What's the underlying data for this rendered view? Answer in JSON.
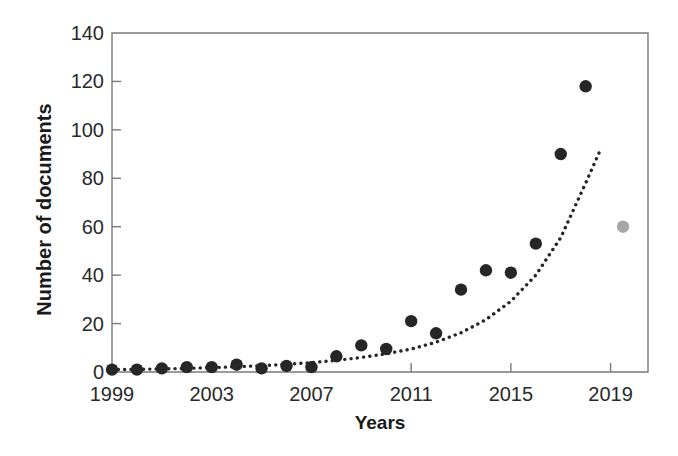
{
  "chart_data": {
    "type": "scatter",
    "title": "",
    "xlabel": "Years",
    "ylabel": "Number of documents",
    "xlim": [
      1999,
      2020.5
    ],
    "ylim": [
      0,
      140
    ],
    "grid": false,
    "legend": null,
    "x_ticks": [
      "1999",
      "2003",
      "2007",
      "2011",
      "2015",
      "2019"
    ],
    "x_tick_values": [
      1999,
      2003,
      2007,
      2011,
      2015,
      2019
    ],
    "y_ticks": [
      "0",
      "20",
      "40",
      "60",
      "80",
      "100",
      "120",
      "140"
    ],
    "y_tick_values": [
      0,
      20,
      40,
      60,
      80,
      100,
      120,
      140
    ],
    "series": [
      {
        "name": "Documents per year",
        "marker": "filled-circle",
        "color": "#262626",
        "x": [
          1999,
          2000,
          2001,
          2002,
          2003,
          2004,
          2005,
          2006,
          2007,
          2008,
          2009,
          2010,
          2011,
          2012,
          2013,
          2014,
          2015,
          2016,
          2017,
          2018
        ],
        "values": [
          1,
          1,
          1.5,
          2,
          2,
          3,
          1.5,
          2.5,
          2,
          6.5,
          11,
          9.5,
          21,
          16,
          34,
          42,
          41,
          53,
          90,
          118
        ]
      },
      {
        "name": "Partial year (incomplete)",
        "marker": "filled-circle",
        "color": "#a6a6a6",
        "x": [
          2019.5
        ],
        "values": [
          60
        ]
      }
    ],
    "trend": {
      "name": "Exponential trend",
      "style": "dotted",
      "color": "#262626",
      "x": [
        1999,
        2000,
        2001,
        2002,
        2003,
        2004,
        2005,
        2006,
        2007,
        2008,
        2009,
        2010,
        2011,
        2012,
        2013,
        2014,
        2015,
        2016,
        2017,
        2018,
        2018.6
      ],
      "values": [
        1.0,
        1.1,
        1.3,
        1.5,
        1.8,
        2.2,
        2.6,
        3.2,
        3.9,
        4.8,
        6.0,
        7.5,
        9.5,
        12.3,
        16.2,
        21.6,
        29.2,
        40.0,
        55.5,
        78.0,
        92.0
      ]
    },
    "axis_color": "#7a7a7a",
    "background": "#ffffff"
  }
}
